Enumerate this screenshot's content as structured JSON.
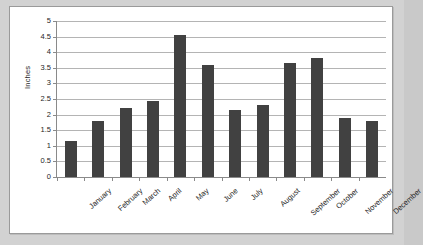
{
  "chart_data": {
    "type": "bar",
    "title": "",
    "xlabel": "",
    "ylabel": "Inches",
    "categories": [
      "January",
      "February",
      "March",
      "April",
      "May",
      "June",
      "July",
      "August",
      "September",
      "October",
      "November",
      "December"
    ],
    "values": [
      1.15,
      1.8,
      2.2,
      2.45,
      4.55,
      3.6,
      2.15,
      2.3,
      3.65,
      3.8,
      1.88,
      1.8
    ],
    "ylim": [
      0,
      5
    ],
    "ytick_labels": [
      "5",
      "4.5",
      "4",
      "3.5",
      "3",
      "2.5",
      "2",
      "1.5",
      "1",
      "0.5",
      "0"
    ],
    "ytick_values": [
      5,
      4.5,
      4,
      3.5,
      3,
      2.5,
      2,
      1.5,
      1,
      0.5,
      0
    ],
    "grid": true,
    "legend": "none",
    "series": [
      {
        "name": "Inches",
        "values": [
          1.15,
          1.8,
          2.2,
          2.45,
          4.55,
          3.6,
          2.15,
          2.3,
          3.65,
          3.8,
          1.88,
          1.8
        ]
      }
    ],
    "colors": {
      "bar": "#414141",
      "gridline": "#b4b4b4",
      "axis": "#8a8a8a",
      "plot_background": "#ffffff",
      "page_background": "#d2d2d2",
      "text": "#262626"
    }
  }
}
